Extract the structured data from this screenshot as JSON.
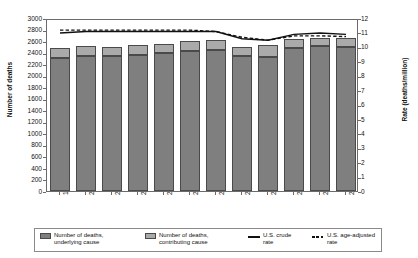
{
  "chart_data": {
    "type": "bar",
    "title": "",
    "xlabel": "",
    "ylabel": "Number of deaths",
    "y2label": "Rate (deaths/million)",
    "categories": [
      "1999",
      "2000",
      "2001",
      "2002",
      "2003",
      "2004",
      "2005",
      "2006",
      "2007",
      "2008",
      "2009",
      "2010"
    ],
    "ylim": [
      0,
      3000
    ],
    "yticks": [
      0,
      200,
      400,
      600,
      800,
      1000,
      1200,
      1400,
      1600,
      1800,
      2000,
      2200,
      2400,
      2600,
      2800,
      3000
    ],
    "y2lim": [
      0,
      12
    ],
    "y2ticks": [
      0,
      1,
      2,
      3,
      4,
      5,
      6,
      7,
      8,
      9,
      10,
      11,
      12
    ],
    "grid": false,
    "legend_position": "bottom",
    "stacked": true,
    "series": [
      {
        "name": "Number of deaths, underlying cause",
        "type": "bar",
        "color": "#7f7f7f",
        "axis": "left",
        "values": [
          2310,
          2345,
          2340,
          2360,
          2400,
          2425,
          2445,
          2340,
          2330,
          2475,
          2520,
          2500
        ]
      },
      {
        "name": "Number of deaths, contributing cause",
        "type": "bar",
        "color": "#aaaaaa",
        "axis": "left",
        "values": [
          165,
          175,
          150,
          175,
          155,
          175,
          175,
          165,
          195,
          165,
          135,
          145
        ]
      },
      {
        "name": "U.S. crude rate",
        "type": "line",
        "style": "solid",
        "color": "#111111",
        "axis": "right",
        "values": [
          11.1,
          11.2,
          11.2,
          11.2,
          11.2,
          11.2,
          11.2,
          10.7,
          10.6,
          11.0,
          11.1,
          11.0
        ]
      },
      {
        "name": "U.S. age-adjusted rate",
        "type": "line",
        "style": "dashed",
        "color": "#111111",
        "axis": "right",
        "values": [
          11.3,
          11.3,
          11.3,
          11.3,
          11.3,
          11.3,
          11.2,
          10.8,
          10.6,
          10.9,
          10.9,
          10.85
        ]
      }
    ],
    "totals": [
      2475,
      2520,
      2490,
      2535,
      2555,
      2600,
      2620,
      2505,
      2525,
      2640,
      2655,
      2645
    ]
  },
  "legend": {
    "items": [
      {
        "label": "Number of deaths,\nunderlying cause",
        "marker": "dark-swatch"
      },
      {
        "label": "Number of deaths,\ncontributing cause",
        "marker": "light-swatch"
      },
      {
        "label": "U.S. crude\nrate",
        "marker": "solid-line"
      },
      {
        "label": "U.S. age-adjusted\nrate",
        "marker": "dashed-line"
      }
    ]
  }
}
